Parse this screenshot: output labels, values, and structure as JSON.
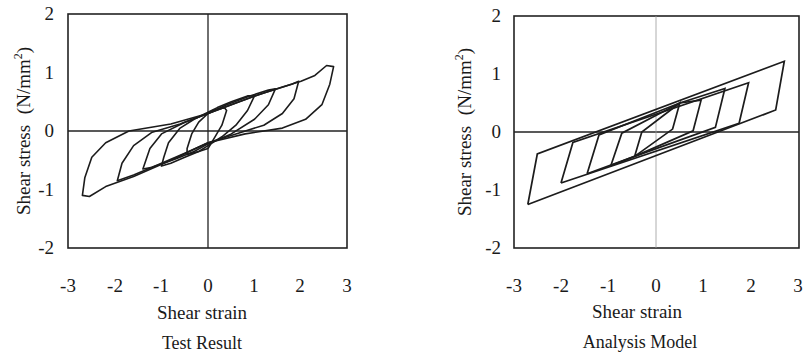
{
  "chart_data": [
    {
      "type": "line",
      "title": "Test Result",
      "xlabel": "Shear strain",
      "ylabel": "Shear stress  (N/mm²)",
      "ylabel_main": "Shear stress",
      "ylabel_unit": "(N/mm",
      "ylabel_sup": "2",
      "ylabel_close": ")",
      "xlim": [
        -3,
        3
      ],
      "ylim": [
        -2,
        2
      ],
      "xticks": [
        "-3",
        "-2",
        "-1",
        "0",
        "1",
        "2",
        "3"
      ],
      "yticks": [
        "2",
        "1",
        "0",
        "-1",
        "-2"
      ],
      "grid": false,
      "zero_lines": true,
      "series": [
        {
          "name": "loop-0.5",
          "points": [
            [
              0,
              -0.3
            ],
            [
              0.15,
              -0.1
            ],
            [
              0.3,
              0.1
            ],
            [
              0.4,
              0.35
            ],
            [
              0.35,
              0.4
            ],
            [
              0.1,
              0.35
            ],
            [
              0,
              0.3
            ],
            [
              -0.2,
              0.15
            ],
            [
              -0.35,
              -0.05
            ],
            [
              -0.45,
              -0.3
            ],
            [
              -0.45,
              -0.4
            ],
            [
              -0.2,
              -0.35
            ],
            [
              0,
              -0.3
            ]
          ]
        },
        {
          "name": "loop-1.0",
          "points": [
            [
              0,
              -0.25
            ],
            [
              0.3,
              -0.1
            ],
            [
              0.6,
              0.1
            ],
            [
              0.85,
              0.35
            ],
            [
              1.0,
              0.6
            ],
            [
              0.85,
              0.6
            ],
            [
              0.5,
              0.5
            ],
            [
              0.2,
              0.4
            ],
            [
              0,
              0.32
            ],
            [
              -0.3,
              0.2
            ],
            [
              -0.6,
              0.05
            ],
            [
              -0.85,
              -0.2
            ],
            [
              -0.95,
              -0.45
            ],
            [
              -1.0,
              -0.6
            ],
            [
              -0.8,
              -0.55
            ],
            [
              -0.5,
              -0.45
            ],
            [
              -0.2,
              -0.35
            ],
            [
              0,
              -0.25
            ]
          ]
        },
        {
          "name": "loop-1.5",
          "points": [
            [
              0,
              -0.22
            ],
            [
              0.5,
              -0.05
            ],
            [
              1.0,
              0.2
            ],
            [
              1.3,
              0.45
            ],
            [
              1.45,
              0.72
            ],
            [
              1.3,
              0.7
            ],
            [
              0.9,
              0.6
            ],
            [
              0.4,
              0.45
            ],
            [
              0,
              0.3
            ],
            [
              -0.5,
              0.15
            ],
            [
              -1.0,
              -0.05
            ],
            [
              -1.25,
              -0.3
            ],
            [
              -1.4,
              -0.65
            ],
            [
              -1.2,
              -0.62
            ],
            [
              -0.7,
              -0.48
            ],
            [
              -0.3,
              -0.35
            ],
            [
              0,
              -0.22
            ]
          ]
        },
        {
          "name": "loop-2.0",
          "points": [
            [
              0,
              -0.2
            ],
            [
              0.6,
              -0.05
            ],
            [
              1.2,
              0.1
            ],
            [
              1.6,
              0.3
            ],
            [
              1.85,
              0.55
            ],
            [
              1.95,
              0.85
            ],
            [
              1.8,
              0.8
            ],
            [
              1.2,
              0.65
            ],
            [
              0.6,
              0.48
            ],
            [
              0,
              0.3
            ],
            [
              -0.6,
              0.12
            ],
            [
              -1.2,
              -0.02
            ],
            [
              -1.6,
              -0.25
            ],
            [
              -1.85,
              -0.55
            ],
            [
              -1.95,
              -0.85
            ],
            [
              -1.6,
              -0.75
            ],
            [
              -1.0,
              -0.55
            ],
            [
              -0.5,
              -0.38
            ],
            [
              0,
              -0.2
            ]
          ]
        },
        {
          "name": "loop-2.7",
          "points": [
            [
              0,
              -0.2
            ],
            [
              0.8,
              -0.05
            ],
            [
              1.6,
              0.05
            ],
            [
              2.1,
              0.2
            ],
            [
              2.45,
              0.45
            ],
            [
              2.62,
              0.8
            ],
            [
              2.7,
              1.1
            ],
            [
              2.55,
              1.12
            ],
            [
              2.3,
              0.95
            ],
            [
              2.0,
              0.85
            ],
            [
              1.6,
              0.75
            ],
            [
              1.0,
              0.6
            ],
            [
              0.4,
              0.42
            ],
            [
              0,
              0.3
            ],
            [
              -0.8,
              0.12
            ],
            [
              -1.7,
              0.0
            ],
            [
              -2.2,
              -0.2
            ],
            [
              -2.5,
              -0.45
            ],
            [
              -2.65,
              -0.8
            ],
            [
              -2.7,
              -1.1
            ],
            [
              -2.55,
              -1.12
            ],
            [
              -2.2,
              -0.95
            ],
            [
              -1.6,
              -0.78
            ],
            [
              -0.8,
              -0.5
            ],
            [
              0,
              -0.2
            ]
          ]
        }
      ]
    },
    {
      "type": "line",
      "title": "Analysis Model",
      "xlabel": "Shear strain",
      "ylabel": "Shear stress  (N/mm²)",
      "ylabel_main": "Shear stress",
      "ylabel_unit": "(N/mm",
      "ylabel_sup": "2",
      "ylabel_close": ")",
      "xlim": [
        -3,
        3
      ],
      "ylim": [
        -2,
        2
      ],
      "xticks": [
        "-3",
        "-2",
        "-1",
        "0",
        "1",
        "2",
        "3"
      ],
      "yticks": [
        "2",
        "1",
        "0",
        "-1",
        "-2"
      ],
      "grid": false,
      "zero_lines": true,
      "series": [
        {
          "name": "loop-0.5",
          "points": [
            [
              -0.45,
              -0.42
            ],
            [
              -0.3,
              0.0
            ],
            [
              0.5,
              0.5
            ],
            [
              0.35,
              0.05
            ],
            [
              -0.45,
              -0.42
            ]
          ]
        },
        {
          "name": "loop-1.0",
          "points": [
            [
              -0.95,
              -0.58
            ],
            [
              -0.72,
              -0.02
            ],
            [
              0.5,
              0.5
            ],
            [
              0.95,
              0.55
            ],
            [
              0.78,
              0.02
            ],
            [
              -0.45,
              -0.42
            ],
            [
              -0.95,
              -0.58
            ]
          ]
        },
        {
          "name": "loop-1.5",
          "points": [
            [
              -1.45,
              -0.72
            ],
            [
              -1.2,
              -0.05
            ],
            [
              0.5,
              0.5
            ],
            [
              1.45,
              0.75
            ],
            [
              1.25,
              0.08
            ],
            [
              -0.45,
              -0.42
            ],
            [
              -1.45,
              -0.72
            ]
          ]
        },
        {
          "name": "loop-2.0",
          "points": [
            [
              -2.0,
              -0.88
            ],
            [
              -1.75,
              -0.18
            ],
            [
              1.95,
              0.85
            ],
            [
              1.75,
              0.15
            ],
            [
              -2.0,
              -0.88
            ]
          ]
        },
        {
          "name": "loop-2.7",
          "points": [
            [
              -2.7,
              -1.25
            ],
            [
              -2.5,
              -0.38
            ],
            [
              2.7,
              1.22
            ],
            [
              2.52,
              0.38
            ],
            [
              -2.7,
              -1.25
            ]
          ]
        }
      ]
    }
  ]
}
